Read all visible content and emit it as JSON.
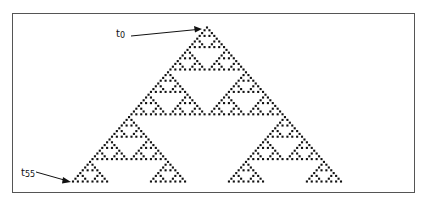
{
  "figure": {
    "title": "",
    "automaton": "Pascal triangle mod 2 (Sierpinski pattern)",
    "rows": 56,
    "labels": {
      "top": {
        "base": "t",
        "sub": "0"
      },
      "bottom": {
        "base": "t",
        "sub": "55"
      }
    },
    "colors": {
      "cell": "#111111",
      "frame": "#555555",
      "background": "#ffffff"
    }
  }
}
